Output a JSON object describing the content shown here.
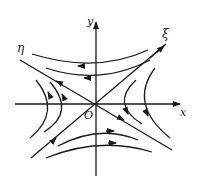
{
  "diagram": {
    "type": "saddle-point phase portrait",
    "labels": {
      "x_axis": "x",
      "y_axis": "y",
      "origin": "O",
      "eta_axis": "η",
      "xi_axis": "ξ"
    },
    "colors": {
      "ink": "#1a1a1a",
      "background": "#ffffff"
    }
  }
}
